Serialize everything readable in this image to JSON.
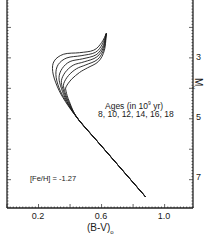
{
  "chart_data": {
    "type": "line",
    "title": "",
    "xlabel": "(B-V)o",
    "ylabel": "Mv",
    "xlim": [
      0.0,
      1.18
    ],
    "ylim": [
      7.93,
      1.1
    ],
    "y_inverted": true,
    "y_axis_position": "right",
    "grid": false,
    "x_ticks": [
      0.2,
      0.6,
      1.0
    ],
    "x_tick_labels": [
      "0.2",
      "0.6",
      "1.0"
    ],
    "y_ticks": [
      3,
      5,
      7
    ],
    "y_tick_labels": [
      "3",
      "5",
      "7"
    ],
    "annotations": [
      {
        "text": "Ages (in 10^9 yr)",
        "x": 0.68,
        "y": 4.5
      },
      {
        "text": "8, 10, 12, 14, 16, 18",
        "x": 0.68,
        "y": 4.85
      },
      {
        "text": "[Fe/H] = -1.27",
        "x": 0.22,
        "y": 6.9
      }
    ],
    "legend": {
      "position": "none"
    },
    "series": [
      {
        "name": "8 Gyr",
        "x": [
          0.88,
          0.6,
          0.45,
          0.37,
          0.32,
          0.29,
          0.3,
          0.36,
          0.46,
          0.55,
          0.6,
          0.63
        ],
        "y": [
          7.57,
          5.9,
          5.0,
          4.43,
          3.95,
          3.45,
          3.1,
          2.88,
          2.83,
          2.75,
          2.5,
          2.2
        ]
      },
      {
        "name": "10 Gyr",
        "x": [
          0.88,
          0.6,
          0.45,
          0.375,
          0.33,
          0.31,
          0.325,
          0.38,
          0.47,
          0.56,
          0.605,
          0.63
        ],
        "y": [
          7.57,
          5.9,
          5.0,
          4.43,
          3.98,
          3.55,
          3.22,
          3.0,
          2.93,
          2.82,
          2.55,
          2.2
        ]
      },
      {
        "name": "12 Gyr",
        "x": [
          0.88,
          0.6,
          0.45,
          0.38,
          0.345,
          0.33,
          0.35,
          0.4,
          0.48,
          0.565,
          0.61,
          0.63
        ],
        "y": [
          7.57,
          5.9,
          5.0,
          4.43,
          4.0,
          3.65,
          3.35,
          3.12,
          3.03,
          2.9,
          2.6,
          2.2
        ]
      },
      {
        "name": "14 Gyr",
        "x": [
          0.88,
          0.6,
          0.45,
          0.385,
          0.355,
          0.345,
          0.37,
          0.42,
          0.49,
          0.57,
          0.612,
          0.63
        ],
        "y": [
          7.57,
          5.9,
          5.0,
          4.43,
          4.03,
          3.75,
          3.47,
          3.24,
          3.13,
          2.97,
          2.65,
          2.2
        ]
      },
      {
        "name": "16 Gyr",
        "x": [
          0.88,
          0.6,
          0.45,
          0.39,
          0.365,
          0.36,
          0.39,
          0.44,
          0.5,
          0.575,
          0.615,
          0.63
        ],
        "y": [
          7.57,
          5.9,
          5.0,
          4.43,
          4.07,
          3.85,
          3.58,
          3.36,
          3.23,
          3.05,
          2.7,
          2.2
        ]
      },
      {
        "name": "18 Gyr",
        "x": [
          0.88,
          0.6,
          0.45,
          0.395,
          0.375,
          0.375,
          0.41,
          0.46,
          0.51,
          0.58,
          0.618,
          0.63
        ],
        "y": [
          7.57,
          5.9,
          5.0,
          4.43,
          4.1,
          3.95,
          3.7,
          3.48,
          3.33,
          3.12,
          2.75,
          2.2
        ]
      }
    ]
  },
  "labels": {
    "ages_line1": "Ages (in 10",
    "ages_exp": "9",
    "ages_unit": " yr)",
    "ages_line2": "8, 10, 12, 14, 16, 18",
    "feh": "[Fe/H] = -1.27",
    "xlabel": "(B-V)",
    "xlabel_sub": "o",
    "ylabel": "M",
    "ylabel_sub": "v",
    "x_ticks": [
      "0.2",
      "0.6",
      "1.0"
    ],
    "y_ticks": [
      "3",
      "5",
      "7"
    ]
  }
}
